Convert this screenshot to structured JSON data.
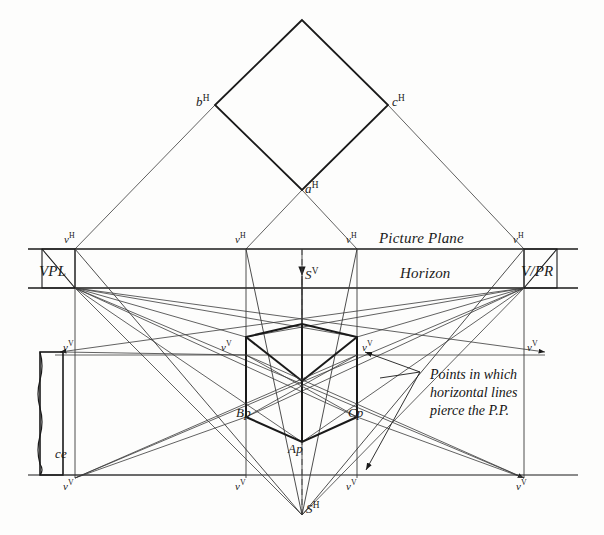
{
  "figure": {
    "ink_color": "#1a1a1a",
    "paper_color": "#fdfdfc"
  },
  "labels": {
    "picture_plane": "Picture Plane",
    "horizon": "Horizon",
    "vpl": "VPL",
    "vpr": "V/PR",
    "station_point_front": "S",
    "station_point_front_sup": "V",
    "station_point_top": "S",
    "station_point_top_sup": "H",
    "point_a_top": "a",
    "point_a_top_sup": "H",
    "point_b_top": "b",
    "point_b_top_sup": "H",
    "point_c_top": "c",
    "point_c_top_sup": "H",
    "point_a_persp": "Ap",
    "point_b_persp": "Bp",
    "point_c_persp": "Cp",
    "ce": "ce",
    "v_top": "v",
    "v_top_sup": "H",
    "v_front": "v",
    "v_front_sup": "V",
    "annotation_line1": "Points in which",
    "annotation_line2": "horizontal lines",
    "annotation_line3": "pierce the P.P."
  },
  "geometry": {
    "picture_plane_y": 249,
    "horizon_y": 288,
    "mid_band_y": 355,
    "ground_line_y": 475,
    "vertical_x": [
      75,
      246,
      357,
      524
    ],
    "cube_center_x": 302,
    "diamond": {
      "apex_x": 302,
      "apex_y": 20,
      "left_x": 215,
      "left_y": 105,
      "right_x": 388,
      "right_y": 105,
      "bottom_x": 302,
      "bottom_y": 190
    },
    "station_point_top": {
      "x": 302,
      "y": 515
    },
    "cube": {
      "left_x": 246,
      "right_x": 357,
      "center_x": 302,
      "top_front_y": 337,
      "top_back_y": 324,
      "bottom_side_y": 417,
      "bottom_front_y": 442,
      "waist_y": 381
    }
  },
  "marker_rows": {
    "picture_plane_markers_x": [
      75,
      246,
      357,
      524
    ],
    "mid_band_markers_x": [
      75,
      246,
      357,
      524
    ],
    "ground_markers_x": [
      75,
      246,
      357,
      524
    ]
  }
}
